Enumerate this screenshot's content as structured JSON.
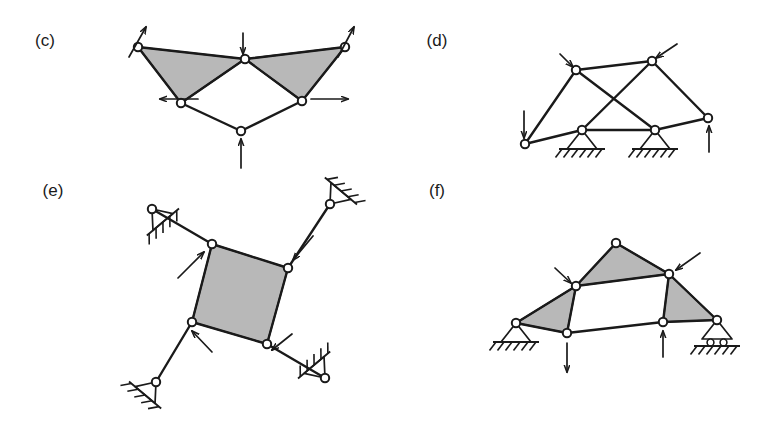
{
  "figure": {
    "background_color": "#ffffff",
    "line_color": "#1a1a1a",
    "shade_color": "#b8b8b8",
    "node_fill": "#ffffff",
    "panels": [
      {
        "id": "c",
        "label": "(c)",
        "label_pos": [
          45,
          46
        ],
        "description": "Two shaded triangles meeting at an apex above an open quadrilateral, loaded by five arrows, no ground supports",
        "nodes": [
          {
            "name": "top-left",
            "x": 138,
            "y": 47
          },
          {
            "name": "apex",
            "x": 245,
            "y": 59
          },
          {
            "name": "top-right",
            "x": 345,
            "y": 47
          },
          {
            "name": "mid-left",
            "x": 181,
            "y": 103
          },
          {
            "name": "mid-right",
            "x": 302,
            "y": 101
          },
          {
            "name": "bottom",
            "x": 241,
            "y": 131
          }
        ],
        "members": [
          [
            "top-left",
            "apex"
          ],
          [
            "top-left",
            "mid-left"
          ],
          [
            "apex",
            "mid-left"
          ],
          [
            "apex",
            "top-right"
          ],
          [
            "apex",
            "mid-right"
          ],
          [
            "top-right",
            "mid-right"
          ],
          [
            "mid-left",
            "bottom"
          ],
          [
            "mid-right",
            "bottom"
          ]
        ],
        "shaded_faces": [
          [
            "top-left",
            "apex",
            "mid-left"
          ],
          [
            "apex",
            "top-right",
            "mid-right"
          ]
        ],
        "arrows": [
          {
            "name": "load-top-left",
            "x1": 129,
            "y1": 57,
            "x2": 146,
            "y2": 27,
            "direction": "up-right"
          },
          {
            "name": "load-apex",
            "x1": 243,
            "y1": 33,
            "x2": 243,
            "y2": 54,
            "direction": "down"
          },
          {
            "name": "load-top-right",
            "x1": 338,
            "y1": 57,
            "x2": 354,
            "y2": 27,
            "direction": "up-right"
          },
          {
            "name": "load-mid-left",
            "x1": 198,
            "y1": 99,
            "x2": 160,
            "y2": 99,
            "direction": "left"
          },
          {
            "name": "load-mid-right",
            "x1": 311,
            "y1": 99,
            "x2": 348,
            "y2": 99,
            "direction": "right"
          },
          {
            "name": "load-bottom",
            "x1": 241,
            "y1": 168,
            "x2": 241,
            "y2": 139,
            "direction": "up"
          }
        ],
        "supports": []
      },
      {
        "id": "d",
        "label": "(d)",
        "label_pos": [
          437,
          46
        ],
        "description": "Truss with two crossing diagonal members and two pinned ground supports, loaded by three arrows",
        "nodes": [
          {
            "name": "upper-left",
            "x": 576,
            "y": 70
          },
          {
            "name": "upper-right",
            "x": 652,
            "y": 61
          },
          {
            "name": "lower-left",
            "x": 525,
            "y": 144
          },
          {
            "name": "support-left",
            "x": 582,
            "y": 130
          },
          {
            "name": "support-right",
            "x": 655,
            "y": 130
          },
          {
            "name": "lower-right",
            "x": 708,
            "y": 118
          }
        ],
        "members": [
          [
            "upper-left",
            "upper-right"
          ],
          [
            "upper-left",
            "lower-left"
          ],
          [
            "upper-left",
            "support-right"
          ],
          [
            "upper-right",
            "support-left"
          ],
          [
            "upper-right",
            "lower-right"
          ],
          [
            "lower-left",
            "support-left"
          ],
          [
            "support-left",
            "support-right"
          ],
          [
            "support-right",
            "lower-right"
          ]
        ],
        "shaded_faces": [],
        "arrows": [
          {
            "name": "load-upper-left",
            "x1": 560,
            "y1": 54,
            "x2": 573,
            "y2": 67,
            "direction": "down-right"
          },
          {
            "name": "load-upper-right",
            "x1": 677,
            "y1": 44,
            "x2": 656,
            "y2": 58,
            "direction": "up-left"
          },
          {
            "name": "load-lower-left",
            "x1": 524,
            "y1": 111,
            "x2": 524,
            "y2": 138,
            "direction": "down"
          },
          {
            "name": "load-lower-right",
            "x1": 709,
            "y1": 152,
            "x2": 709,
            "y2": 126,
            "direction": "up"
          }
        ],
        "supports": [
          {
            "name": "pin-support-left",
            "type": "pin",
            "x": 582,
            "y": 130
          },
          {
            "name": "pin-support-right",
            "type": "pin",
            "x": 655,
            "y": 130
          }
        ]
      },
      {
        "id": "e",
        "label": "(e)",
        "label_pos": [
          53,
          196
        ],
        "description": "Central shaded quadrilateral panel with four inclined legs ending at angled pinned supports, loaded by four inward arrows",
        "nodes": [
          {
            "name": "quad-top-left",
            "x": 212,
            "y": 244
          },
          {
            "name": "quad-top-right",
            "x": 288,
            "y": 268
          },
          {
            "name": "quad-bottom-right",
            "x": 267,
            "y": 344
          },
          {
            "name": "quad-bottom-left",
            "x": 192,
            "y": 322
          },
          {
            "name": "anchor-top-left",
            "x": 152,
            "y": 209
          },
          {
            "name": "anchor-top-right",
            "x": 330,
            "y": 204
          },
          {
            "name": "anchor-bottom-left",
            "x": 156,
            "y": 382
          },
          {
            "name": "anchor-bottom-right",
            "x": 325,
            "y": 378
          }
        ],
        "members": [
          [
            "quad-top-left",
            "quad-top-right"
          ],
          [
            "quad-top-right",
            "quad-bottom-right"
          ],
          [
            "quad-bottom-right",
            "quad-bottom-left"
          ],
          [
            "quad-bottom-left",
            "quad-top-left"
          ],
          [
            "quad-top-left",
            "anchor-top-left"
          ],
          [
            "quad-top-right",
            "anchor-top-right"
          ],
          [
            "quad-bottom-left",
            "anchor-bottom-left"
          ],
          [
            "quad-bottom-right",
            "anchor-bottom-right"
          ]
        ],
        "shaded_faces": [
          [
            "quad-top-left",
            "quad-top-right",
            "quad-bottom-right",
            "quad-bottom-left"
          ]
        ],
        "arrows": [
          {
            "name": "load-quad-top-left",
            "x1": 178,
            "y1": 278,
            "x2": 204,
            "y2": 252,
            "direction": "up-right"
          },
          {
            "name": "load-quad-top-right",
            "x1": 313,
            "y1": 236,
            "x2": 293,
            "y2": 260,
            "direction": "down-left"
          },
          {
            "name": "load-quad-bottom-left",
            "x1": 212,
            "y1": 352,
            "x2": 192,
            "y2": 331,
            "direction": "up-left"
          },
          {
            "name": "load-quad-bottom-right",
            "x1": 292,
            "y1": 334,
            "x2": 272,
            "y2": 350,
            "direction": "down-left"
          }
        ],
        "supports": [
          {
            "name": "angled-support-top-left",
            "type": "pin-angled",
            "x": 152,
            "y": 209,
            "angle": -40
          },
          {
            "name": "angled-support-top-right",
            "type": "pin-angled",
            "x": 330,
            "y": 204,
            "angle": 220
          },
          {
            "name": "angled-support-bottom-left",
            "type": "pin-angled",
            "x": 156,
            "y": 382,
            "angle": 40
          },
          {
            "name": "angled-support-bottom-right",
            "type": "pin-angled",
            "x": 325,
            "y": 378,
            "angle": 140
          }
        ]
      },
      {
        "id": "f",
        "label": "(f)",
        "label_pos": [
          437,
          196
        ],
        "description": "Arch-like truss with three shaded triangles, a pinned support at the left and a roller support at the right, loaded by four arrows",
        "nodes": [
          {
            "name": "apex",
            "x": 616,
            "y": 243
          },
          {
            "name": "upper-left",
            "x": 576,
            "y": 286
          },
          {
            "name": "upper-right",
            "x": 669,
            "y": 274
          },
          {
            "name": "left-base",
            "x": 516,
            "y": 323
          },
          {
            "name": "lower-left",
            "x": 567,
            "y": 333
          },
          {
            "name": "lower-right",
            "x": 663,
            "y": 322
          },
          {
            "name": "right-base",
            "x": 717,
            "y": 320
          }
        ],
        "members": [
          [
            "apex",
            "upper-left"
          ],
          [
            "apex",
            "upper-right"
          ],
          [
            "upper-left",
            "upper-right"
          ],
          [
            "upper-left",
            "left-base"
          ],
          [
            "upper-left",
            "lower-left"
          ],
          [
            "left-base",
            "lower-left"
          ],
          [
            "lower-left",
            "lower-right"
          ],
          [
            "upper-right",
            "lower-right"
          ],
          [
            "upper-right",
            "right-base"
          ],
          [
            "lower-right",
            "right-base"
          ]
        ],
        "shaded_faces": [
          [
            "apex",
            "upper-left",
            "upper-right"
          ],
          [
            "upper-left",
            "left-base",
            "lower-left"
          ],
          [
            "upper-right",
            "lower-right",
            "right-base"
          ]
        ],
        "arrows": [
          {
            "name": "load-upper-left",
            "x1": 555,
            "y1": 268,
            "x2": 571,
            "y2": 283,
            "direction": "down-right"
          },
          {
            "name": "load-upper-right",
            "x1": 700,
            "y1": 253,
            "x2": 676,
            "y2": 270,
            "direction": "up-right"
          },
          {
            "name": "load-lower-left",
            "x1": 567,
            "y1": 343,
            "x2": 567,
            "y2": 372,
            "direction": "down"
          },
          {
            "name": "load-lower-right",
            "x1": 663,
            "y1": 357,
            "x2": 663,
            "y2": 331,
            "direction": "up"
          }
        ],
        "supports": [
          {
            "name": "pin-support-left",
            "type": "pin",
            "x": 516,
            "y": 323
          },
          {
            "name": "roller-support-right",
            "type": "roller",
            "x": 717,
            "y": 320
          }
        ]
      }
    ]
  }
}
